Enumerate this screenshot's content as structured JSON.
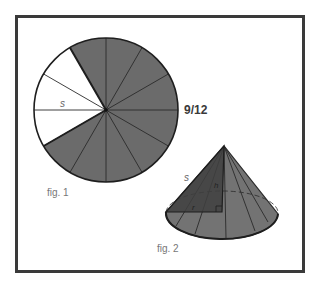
{
  "colors": {
    "frame": "#3a3a3a",
    "sector_fill": "#6b6b6b",
    "cone_fill": "#737373",
    "triangle_fill": "#3f3f3f",
    "line": "#2a2a2a",
    "label_gray": "#777777",
    "background": "#ffffff"
  },
  "fig1": {
    "label": "fig. 1",
    "fraction_label": "9/12",
    "slant_label": "s",
    "total_sectors": 12,
    "shaded_sectors": 9,
    "white_sectors": 3
  },
  "fig2": {
    "label": "fig. 2",
    "slant_label": "s",
    "height_label": "h",
    "radius_label": "r"
  }
}
